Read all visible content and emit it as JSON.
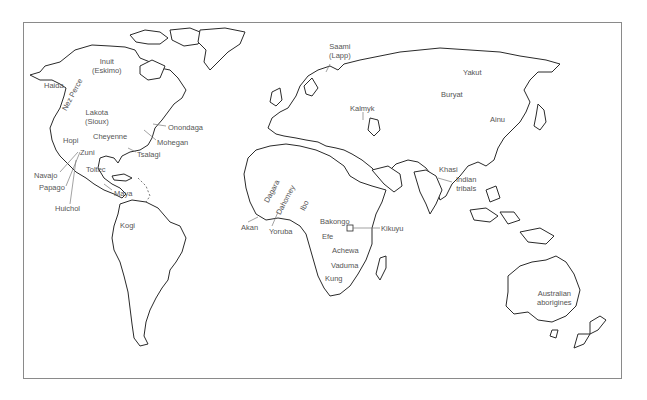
{
  "map": {
    "title": "World map of indigenous peoples",
    "line_color": "#2a2a2a",
    "label_color": "#555555",
    "labels": [
      {
        "id": "inuit",
        "lines": [
          "Inuit",
          "(Eskimo)"
        ],
        "x": 92,
        "y": 57
      },
      {
        "id": "haida",
        "lines": [
          "Haida"
        ],
        "x": 44,
        "y": 81
      },
      {
        "id": "nez-perce",
        "lines": [
          "Nez Perce"
        ],
        "x": 64,
        "y": 114,
        "rotate": -62
      },
      {
        "id": "lakota",
        "lines": [
          "Lakota",
          "(Sioux)"
        ],
        "x": 85,
        "y": 108
      },
      {
        "id": "onondaga",
        "lines": [
          "Onondaga"
        ],
        "x": 168,
        "y": 123
      },
      {
        "id": "cheyenne",
        "lines": [
          "Cheyenne"
        ],
        "x": 93,
        "y": 132
      },
      {
        "id": "mohegan",
        "lines": [
          "Mohegan"
        ],
        "x": 157,
        "y": 138
      },
      {
        "id": "hopi",
        "lines": [
          "Hopi"
        ],
        "x": 63,
        "y": 136
      },
      {
        "id": "zuni",
        "lines": [
          "Zuni"
        ],
        "x": 80,
        "y": 148
      },
      {
        "id": "tsalagi",
        "lines": [
          "Tsalagi"
        ],
        "x": 137,
        "y": 150
      },
      {
        "id": "toltec",
        "lines": [
          "Toltec"
        ],
        "x": 86,
        "y": 165
      },
      {
        "id": "navajo",
        "lines": [
          "Navajo"
        ],
        "x": 34,
        "y": 171
      },
      {
        "id": "papago",
        "lines": [
          "Papago"
        ],
        "x": 39,
        "y": 183
      },
      {
        "id": "maya",
        "lines": [
          "Maya"
        ],
        "x": 114,
        "y": 189
      },
      {
        "id": "huichol",
        "lines": [
          "Huichol"
        ],
        "x": 55,
        "y": 204
      },
      {
        "id": "kogi",
        "lines": [
          "Kogi"
        ],
        "x": 120,
        "y": 221
      },
      {
        "id": "saami",
        "lines": [
          "Saami",
          "(Lapp)"
        ],
        "x": 329,
        "y": 42
      },
      {
        "id": "kalmyk",
        "lines": [
          "Kalmyk"
        ],
        "x": 350,
        "y": 104
      },
      {
        "id": "dagara",
        "lines": [
          "Dagara"
        ],
        "x": 264,
        "y": 198,
        "rotate": -62
      },
      {
        "id": "dahomey",
        "lines": [
          "Dahomey"
        ],
        "x": 276,
        "y": 208,
        "rotate": -62
      },
      {
        "id": "ibo",
        "lines": [
          "Ibo"
        ],
        "x": 298,
        "y": 203,
        "rotate": -62
      },
      {
        "id": "akan",
        "lines": [
          "Akan"
        ],
        "x": 241,
        "y": 223
      },
      {
        "id": "yoruba",
        "lines": [
          "Yoruba"
        ],
        "x": 269,
        "y": 227
      },
      {
        "id": "bakongo",
        "lines": [
          "Bakongo"
        ],
        "x": 320,
        "y": 217
      },
      {
        "id": "kikuyu",
        "lines": [
          "Kikuyu"
        ],
        "x": 381,
        "y": 227
      },
      {
        "id": "efe",
        "lines": [
          "Efe"
        ],
        "x": 322,
        "y": 232
      },
      {
        "id": "achewa",
        "lines": [
          "Achewa"
        ],
        "x": 332,
        "y": 246
      },
      {
        "id": "vaduma",
        "lines": [
          "Vaduma"
        ],
        "x": 331,
        "y": 261
      },
      {
        "id": "kung",
        "lines": [
          "Kung"
        ],
        "x": 325,
        "y": 274
      },
      {
        "id": "yakut",
        "lines": [
          "Yakut"
        ],
        "x": 463,
        "y": 68
      },
      {
        "id": "buryat",
        "lines": [
          "Buryat"
        ],
        "x": 441,
        "y": 90
      },
      {
        "id": "ainu",
        "lines": [
          "Ainu"
        ],
        "x": 490,
        "y": 115
      },
      {
        "id": "khasi",
        "lines": [
          "Khasi"
        ],
        "x": 439,
        "y": 165
      },
      {
        "id": "indian-tribals",
        "lines": [
          "Indian",
          "tribals"
        ],
        "x": 456,
        "y": 175
      },
      {
        "id": "australian-aborigines",
        "lines": [
          "Australian",
          "aborigines"
        ],
        "x": 537,
        "y": 289
      }
    ]
  }
}
